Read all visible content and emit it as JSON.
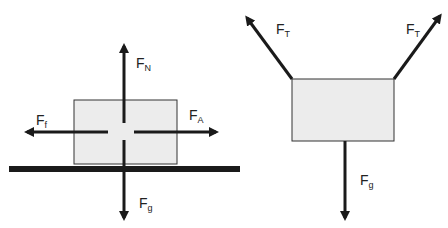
{
  "diagrams": [
    {
      "name": "block-on-surface",
      "forces": [
        {
          "id": "normal",
          "base": "F",
          "sub": "N",
          "direction": "up"
        },
        {
          "id": "friction",
          "base": "F",
          "sub": "f",
          "direction": "left"
        },
        {
          "id": "applied",
          "base": "F",
          "sub": "A",
          "direction": "right"
        },
        {
          "id": "gravity",
          "base": "F",
          "sub": "g",
          "direction": "down"
        }
      ]
    },
    {
      "name": "hanging-block",
      "forces": [
        {
          "id": "tension-left",
          "base": "F",
          "sub": "T",
          "direction": "up-left"
        },
        {
          "id": "tension-right",
          "base": "F",
          "sub": "T",
          "direction": "up-right"
        },
        {
          "id": "gravity",
          "base": "F",
          "sub": "g",
          "direction": "down"
        }
      ]
    }
  ],
  "colors": {
    "block_fill": "#ececec",
    "line": "#1a1a1a",
    "surface": "#1a1a1a"
  }
}
